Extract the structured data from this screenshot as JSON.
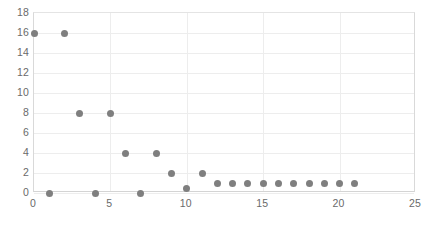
{
  "chart_data": {
    "type": "scatter",
    "title": "",
    "xlabel": "",
    "ylabel": "",
    "xlim": [
      0,
      25
    ],
    "ylim": [
      0,
      18
    ],
    "xticks": [
      0,
      5,
      10,
      15,
      20,
      25
    ],
    "yticks": [
      0,
      2,
      4,
      6,
      8,
      10,
      12,
      14,
      16,
      18
    ],
    "xtick_labels": [
      "0",
      "5",
      "10",
      "15",
      "20",
      "25"
    ],
    "ytick_labels": [
      "0",
      "2",
      "4",
      "6",
      "8",
      "10",
      "12",
      "14",
      "16",
      "18"
    ],
    "grid": true,
    "grid_axes": "both",
    "legend": false,
    "marker_color": "#7f7f7f",
    "gridline_color": "#ededed",
    "axis_label_color": "#6a6a6a",
    "series": [
      {
        "name": "series-1",
        "marker": "circle",
        "color": "#7f7f7f",
        "points": [
          {
            "x": 0,
            "y": 16
          },
          {
            "x": 1,
            "y": 0
          },
          {
            "x": 2,
            "y": 16
          },
          {
            "x": 3,
            "y": 8
          },
          {
            "x": 4,
            "y": 0
          },
          {
            "x": 5,
            "y": 8
          },
          {
            "x": 6,
            "y": 4
          },
          {
            "x": 7,
            "y": 0
          },
          {
            "x": 8,
            "y": 4
          },
          {
            "x": 9,
            "y": 2
          },
          {
            "x": 10,
            "y": 0.5
          },
          {
            "x": 11,
            "y": 2
          },
          {
            "x": 12,
            "y": 1
          },
          {
            "x": 13,
            "y": 1
          },
          {
            "x": 14,
            "y": 1
          },
          {
            "x": 15,
            "y": 1
          },
          {
            "x": 16,
            "y": 1
          },
          {
            "x": 17,
            "y": 1
          },
          {
            "x": 18,
            "y": 1
          },
          {
            "x": 19,
            "y": 1
          },
          {
            "x": 20,
            "y": 1
          },
          {
            "x": 21,
            "y": 1
          }
        ]
      }
    ]
  }
}
